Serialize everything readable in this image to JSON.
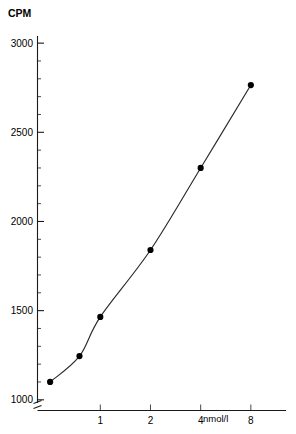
{
  "chart_data": {
    "type": "line",
    "title": "",
    "ylabel": "CPM",
    "xlabel": "nmol/l",
    "xscale": "log",
    "yscale": "linear",
    "grid": false,
    "legend": "none",
    "xlim": [
      0.42,
      13.0
    ],
    "ylim": [
      940,
      3040
    ],
    "x_tick_labels": [
      "1",
      "2",
      "4",
      "8"
    ],
    "x_tick_values": [
      1,
      2,
      4,
      8
    ],
    "y_tick_labels": [
      "1000",
      "1500",
      "2000",
      "2500",
      "3000"
    ],
    "y_tick_values": [
      1000,
      1500,
      2000,
      2500,
      3000
    ],
    "y_minor_step": 100,
    "x": [
      0.5,
      0.75,
      1,
      2,
      4,
      8
    ],
    "values": [
      1100,
      1245,
      1465,
      1840,
      2300,
      2765
    ],
    "series": [
      {
        "name": "standard-curve",
        "x": [
          0.5,
          0.75,
          1,
          2,
          4,
          8
        ],
        "values": [
          1100,
          1245,
          1465,
          1840,
          2300,
          2765
        ]
      }
    ],
    "marker": "filled-circle",
    "marker_size": 3.1,
    "line_color": "#2b2b2b",
    "marker_color": "#000000",
    "axis_color": "#1a1a1a",
    "axis_break": true,
    "annotations": []
  },
  "axes": {
    "y_axis_title": "CPM",
    "x_axis_unit": "nmol/l"
  }
}
